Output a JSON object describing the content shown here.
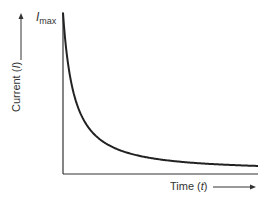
{
  "chart_data": {
    "type": "line",
    "title": "",
    "xlabel": "Time (t)",
    "ylabel": "Current (I)",
    "annotations": [
      {
        "text": "I_max",
        "position": "top of y-axis"
      }
    ],
    "series": [
      {
        "name": "Current decay",
        "shape": "decaying hyperbolic/exponential approaching zero",
        "x": [
          0,
          0.05,
          0.1,
          0.2,
          0.3,
          0.4,
          0.5,
          0.6,
          0.7,
          0.8,
          0.9,
          1.0
        ],
        "y": [
          1.0,
          0.62,
          0.45,
          0.28,
          0.19,
          0.13,
          0.09,
          0.065,
          0.05,
          0.04,
          0.035,
          0.03
        ]
      }
    ],
    "xlim": [
      0,
      1
    ],
    "ylim": [
      0,
      1
    ],
    "grid": false,
    "legend": "none",
    "ticks": "none"
  },
  "labels": {
    "y_axis_prefix": "Current (",
    "y_axis_var": "I",
    "y_axis_suffix": ")",
    "imax_main": "I",
    "imax_sub": "max",
    "x_axis_prefix": "Time (",
    "x_axis_var": "t",
    "x_axis_suffix": ")"
  }
}
